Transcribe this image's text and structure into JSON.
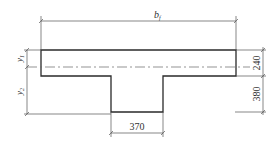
{
  "diagram": {
    "type": "T-section cross-section",
    "labels": {
      "flange_width": "b",
      "flange_width_sub": "f",
      "y1": "y",
      "y1_sub": "1",
      "y2": "y",
      "y2_sub": "2",
      "flange_thickness": "240",
      "web_height": "380",
      "web_width": "370"
    },
    "colors": {
      "outline": "#2a2a2a",
      "dimension": "#555555",
      "text": "#333333",
      "background": "#ffffff"
    }
  }
}
